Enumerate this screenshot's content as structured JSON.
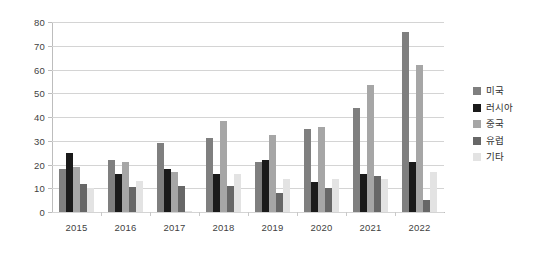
{
  "chart_data": {
    "type": "bar",
    "title": "",
    "subtitle": "",
    "xlabel": "",
    "ylabel": "",
    "categories": [
      "2015",
      "2016",
      "2017",
      "2018",
      "2019",
      "2020",
      "2021",
      "2022"
    ],
    "series": [
      {
        "name": "미국",
        "color": "#7f7f7f",
        "values": [
          18,
          22,
          29,
          31,
          21,
          35,
          44,
          76
        ]
      },
      {
        "name": "러시아",
        "color": "#1a1a1a",
        "values": [
          25,
          16,
          18,
          16,
          22,
          12.5,
          16,
          21
        ]
      },
      {
        "name": "중국",
        "color": "#a6a6a6",
        "values": [
          19,
          21,
          17,
          38.5,
          32.5,
          36,
          53.5,
          62
        ]
      },
      {
        "name": "유럽",
        "color": "#676767",
        "values": [
          12,
          10.5,
          11,
          11,
          8,
          10,
          15,
          5
        ]
      },
      {
        "name": "기타",
        "color": "#e3e3e3",
        "values": [
          10,
          13,
          0.5,
          16,
          14,
          14,
          14,
          17
        ]
      }
    ],
    "ylim": [
      0,
      80
    ],
    "yticks": [
      0,
      10,
      20,
      30,
      40,
      50,
      60,
      70,
      80
    ],
    "ytick_labels": [
      "0",
      "10",
      "20",
      "30",
      "40",
      "50",
      "60",
      "70",
      "80"
    ],
    "grid": true,
    "legend_position": "right",
    "background_color": "#ffffff",
    "gridline_color": "#d4d4d4",
    "axis_color": "#bdbdbd",
    "tick_label_color": "#3f3f3f"
  }
}
